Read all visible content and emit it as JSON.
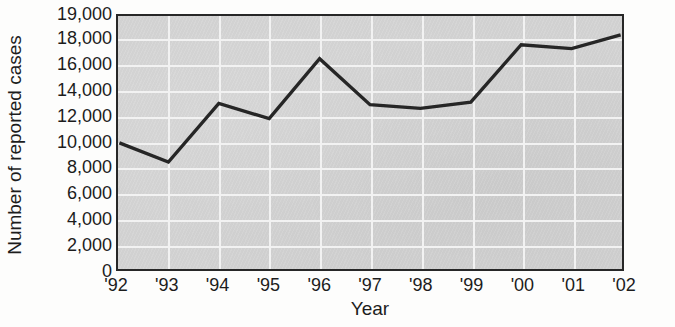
{
  "chart_data": {
    "type": "line",
    "title": "",
    "subtitle": "",
    "xlabel": "Year",
    "ylabel": "Number of reported cases",
    "categories": [
      "'92",
      "'93",
      "'94",
      "'95",
      "'96",
      "'97",
      "'98",
      "'99",
      "'00",
      "'01",
      "'02"
    ],
    "x": [
      "'92",
      "'93",
      "'94",
      "'95",
      "'96",
      "'97",
      "'98",
      "'99",
      "'00",
      "'01",
      "'02"
    ],
    "values": [
      9900,
      8400,
      13000,
      11800,
      16500,
      12900,
      12600,
      13100,
      17600,
      17300,
      18200
    ],
    "series": [
      {
        "name": "Reported cases",
        "values": [
          9900,
          8400,
          13000,
          11800,
          16500,
          12900,
          12600,
          13100,
          17600,
          17300,
          18200
        ]
      }
    ],
    "ylim": [
      0,
      19000
    ],
    "y_ticks": [
      0,
      2000,
      4000,
      6000,
      8000,
      10000,
      12000,
      14000,
      16000,
      18000,
      19000
    ],
    "y_tick_labels": [
      "0",
      "2,000",
      "4,000",
      "6,000",
      "8,000",
      "10,000",
      "12,000",
      "14,000",
      "16,000",
      "18,000",
      "19,000"
    ],
    "x_tick_labels": [
      "'92",
      "'93",
      "'94",
      "'95",
      "'96",
      "'97",
      "'98",
      "'99",
      "'00",
      "'01",
      "'02"
    ],
    "grid": true,
    "grid_color": "#f2f2f2",
    "plot_background_color": "#d4d4d4",
    "line_color": "#262626",
    "line_width": 3.4,
    "axis_color": "#272727",
    "legend": null,
    "legend_position": "none",
    "annotations": []
  },
  "axes": {
    "y_title": "Number of reported cases",
    "x_title": "Year"
  }
}
